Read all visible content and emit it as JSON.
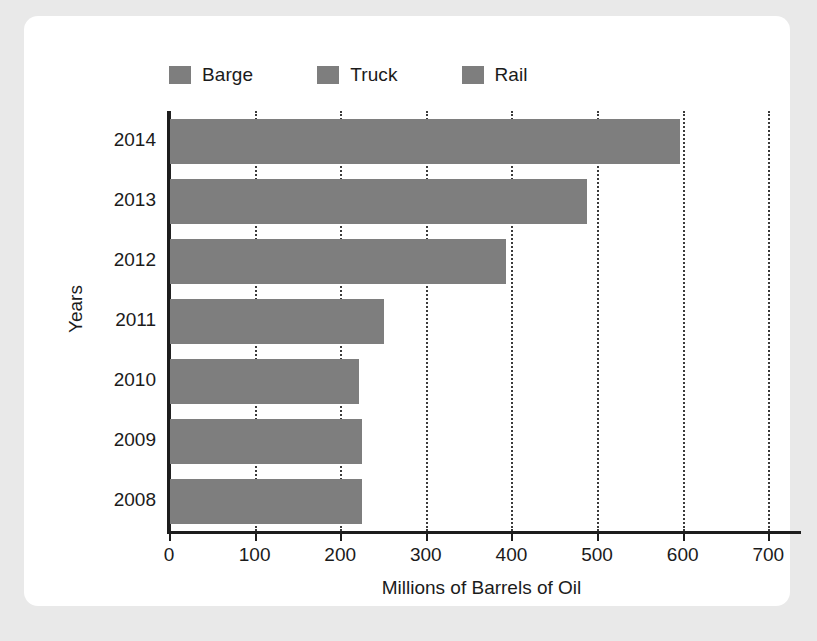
{
  "chart_data": {
    "type": "bar",
    "orientation": "horizontal",
    "title": "",
    "xlabel": "Millions of Barrels of Oil",
    "ylabel": "Years",
    "categories": [
      "2014",
      "2013",
      "2012",
      "2011",
      "2010",
      "2009",
      "2008"
    ],
    "values": [
      597,
      488,
      394,
      251,
      222,
      225,
      226
    ],
    "series": [
      {
        "name": "Barge",
        "categories": [
          "2014",
          "2013",
          "2012",
          "2011",
          "2010",
          "2009",
          "2008"
        ],
        "values": [
          597,
          488,
          394,
          251,
          222,
          225,
          226
        ]
      }
    ],
    "xlim": [
      0,
      730
    ],
    "ylim": null,
    "xticks": [
      0,
      100,
      200,
      300,
      400,
      500,
      600,
      700
    ],
    "xtick_labels": [
      "0",
      "100",
      "200",
      "300",
      "400",
      "500",
      "600",
      "700"
    ],
    "grid": "vertical-dotted",
    "legend_position": "top-left",
    "legend": [
      "Barge",
      "Truck",
      "Rail"
    ],
    "bar_color": "#7e7e7e"
  },
  "legend": {
    "items": [
      {
        "label": "Barge",
        "color": "#7e7e7e",
        "swatch_name": "legend-swatch-barge"
      },
      {
        "label": "Truck",
        "color": "#7e7e7e",
        "swatch_name": "legend-swatch-truck"
      },
      {
        "label": "Rail",
        "color": "#7e7e7e",
        "swatch_name": "legend-swatch-rail"
      }
    ]
  },
  "axes": {
    "x_title": "Millions of Barrels of Oil",
    "y_title": "Years",
    "x_tick_labels": [
      "0",
      "100",
      "200",
      "300",
      "400",
      "500",
      "600",
      "700"
    ],
    "y_tick_labels": [
      "2014",
      "2013",
      "2012",
      "2011",
      "2010",
      "2009",
      "2008"
    ]
  },
  "colors": {
    "page_background": "#e9e9e9",
    "card_background": "#ffffff",
    "bar": "#7e7e7e",
    "axis": "#1d1d1d",
    "grid": "#3b3b3b",
    "text": "#1b1b1b"
  }
}
